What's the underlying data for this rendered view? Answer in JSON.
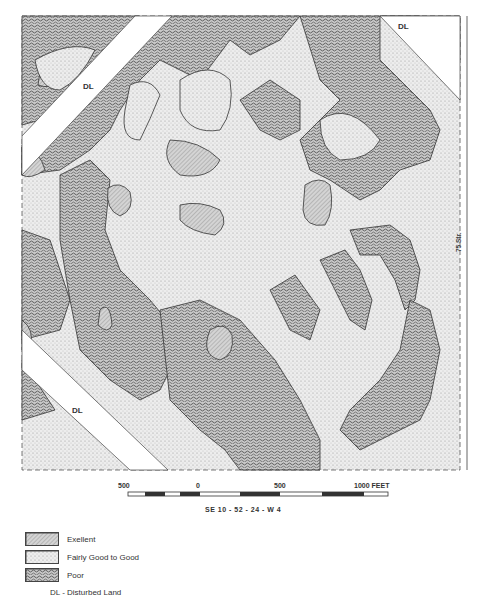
{
  "map": {
    "section_label": "SE 10 - 52 - 24 - W 4",
    "street_label": "75 Str.",
    "disturbed_land_labels": [
      "DL",
      "DL",
      "DL"
    ],
    "colors": {
      "excellent": "#bdbdbd",
      "fairly_good": "#e4e4e4",
      "poor": "#8a8a8a",
      "disturbed": "#ffffff",
      "outline": "#333333"
    }
  },
  "scale_bar": {
    "ticks": [
      "500",
      "0",
      "500",
      "1000 FEET"
    ]
  },
  "legend": {
    "items": [
      {
        "label": "Exellent",
        "swatch": "excellent"
      },
      {
        "label": "Fairly Good to Good",
        "swatch": "fairly_good"
      },
      {
        "label": "Poor",
        "swatch": "poor"
      }
    ],
    "note": "DL - Disturbed Land"
  }
}
